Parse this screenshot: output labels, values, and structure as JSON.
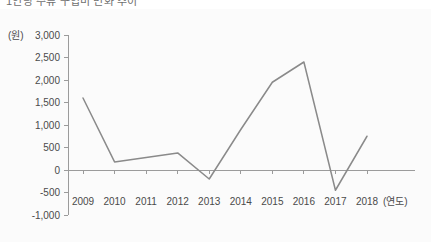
{
  "caption": {
    "text": "1인당 주류 구입비 변화 추이"
  },
  "chart_data": {
    "type": "line",
    "title": "",
    "subtitle": "",
    "xlabel": "(연도)",
    "ylabel": "(원)",
    "unit_label": "(원)",
    "x_axis_suffix": "(연도)",
    "categories": [
      "2009",
      "2010",
      "2011",
      "2012",
      "2013",
      "2014",
      "2015",
      "2016",
      "2017",
      "2018"
    ],
    "values": [
      1600,
      180,
      280,
      380,
      -200,
      900,
      1950,
      2400,
      -450,
      750
    ],
    "series": [
      {
        "name": "구입비",
        "values": [
          1600,
          180,
          280,
          380,
          -200,
          900,
          1950,
          2400,
          -450,
          750
        ],
        "color": "#8a8a8a"
      }
    ],
    "ylim": [
      -1000,
      3000
    ],
    "ytick_step": 500,
    "ytick_labels": [
      "3,000",
      "2,500",
      "2,000",
      "1,500",
      "1,000",
      "500",
      "0",
      "-500",
      "-1,000"
    ],
    "ytick_values": [
      3000,
      2500,
      2000,
      1500,
      1000,
      500,
      0,
      -500,
      -1000
    ],
    "xtick_labels": [
      "2009",
      "2010",
      "2011",
      "2012",
      "2013",
      "2014",
      "2015",
      "2016",
      "2017",
      "2018"
    ],
    "grid": false,
    "legend": "none",
    "zero_line": true,
    "background": "#fbfbfb",
    "axis_color": "#9b9b9b",
    "label_color": "#4a4a4a"
  }
}
